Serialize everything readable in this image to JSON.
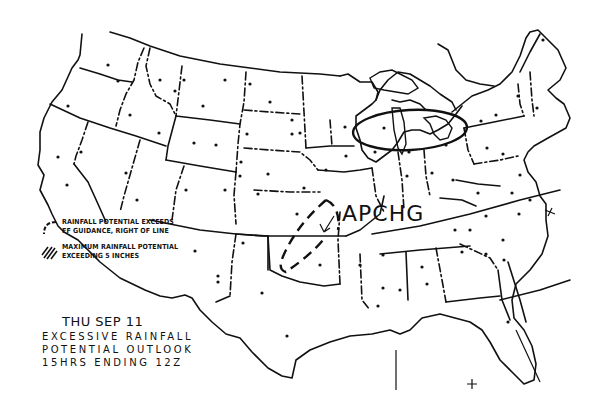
{
  "map": {
    "type": "weather-outlook-map",
    "region": "Continental United States",
    "line_color": "#111111",
    "background": "#ffffff"
  },
  "title": {
    "date": "THU SEP 11",
    "line1": "EXCESSIVE RAINFALL",
    "line2": "POTENTIAL OUTLOOK",
    "line3": "15HRS ENDING 12Z"
  },
  "legend": {
    "items": [
      {
        "icon": "curved-line-icon",
        "line1": "RAINFALL POTENTIAL EXCEEDS",
        "line2": "FF GUIDANCE, RIGHT OF LINE"
      },
      {
        "icon": "hatched-area-icon",
        "line1": "MAXIMUM RAINFALL POTENTIAL",
        "line2": "EXCEEDING 5 INCHES"
      }
    ]
  },
  "annotations": {
    "area_label": "APCHG",
    "areas": [
      {
        "name": "great-lakes-ellipse",
        "description": "Rainfall potential exceeds FF guidance"
      },
      {
        "name": "southern-plains-dashed-area",
        "description": "Rainfall potential exceeds FF guidance"
      }
    ],
    "longitude_marks": [
      "80",
      "80"
    ]
  }
}
